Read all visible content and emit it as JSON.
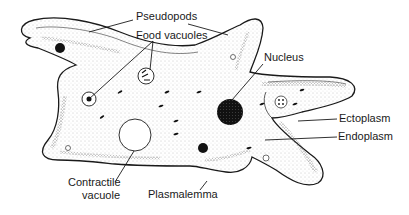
{
  "diagram": {
    "labels": {
      "pseudopods": "Pseudopods",
      "food_vacuoles": "Food vacuoles",
      "nucleus": "Nucleus",
      "ectoplasm": "Ectoplasm",
      "endoplasm": "Endoplasm",
      "contractile_vacuole_line1": "Contractile",
      "contractile_vacuole_line2": "vacuole",
      "plasmalemma": "Plasmalemma"
    },
    "colors": {
      "outline": "#1a1a1a",
      "stipple": "#7a7a7a",
      "background": "#ffffff",
      "nucleus": "#111111"
    }
  }
}
